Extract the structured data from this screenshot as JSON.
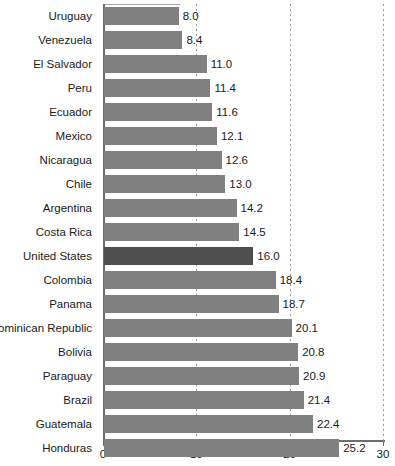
{
  "chart_data": {
    "type": "bar",
    "orientation": "horizontal",
    "title": "",
    "subtitle": "",
    "xlabel": "",
    "ylabel": "",
    "xlim": [
      0,
      30
    ],
    "ylim": null,
    "grid": "vertical dotted gridlines at x = 10, 20, 30",
    "legend": null,
    "xticks": [
      "0",
      "10",
      "20",
      "30"
    ],
    "xtick_values": [
      0,
      10,
      20,
      30
    ],
    "categories": [
      "Uruguay",
      "Venezuela",
      "El Salvador",
      "Peru",
      "Ecuador",
      "Mexico",
      "Nicaragua",
      "Chile",
      "Argentina",
      "Costa Rica",
      "United States",
      "Colombia",
      "Panama",
      "Dominican Republic",
      "Bolivia",
      "Paraguay",
      "Brazil",
      "Guatemala",
      "Honduras"
    ],
    "values": [
      8.0,
      8.4,
      11.0,
      11.4,
      11.6,
      12.1,
      12.6,
      13.0,
      14.2,
      14.5,
      16.0,
      18.4,
      18.7,
      20.1,
      20.8,
      20.9,
      21.4,
      22.4,
      25.2
    ],
    "value_labels": [
      "8.0",
      "8.4",
      "11.0",
      "11.4",
      "11.6",
      "12.1",
      "12.6",
      "13.0",
      "14.2",
      "14.5",
      "16.0",
      "18.4",
      "18.7",
      "20.1",
      "20.8",
      "20.9",
      "21.4",
      "22.4",
      "25.2"
    ],
    "highlighted_category": "United States",
    "colors": {
      "bar": "#808080",
      "bar_highlight": "#4f4f4f",
      "axis": "#6e6e6e",
      "gridline": "#9a9a9a",
      "text": "#1b1b1b",
      "background": "#ffffff"
    }
  }
}
